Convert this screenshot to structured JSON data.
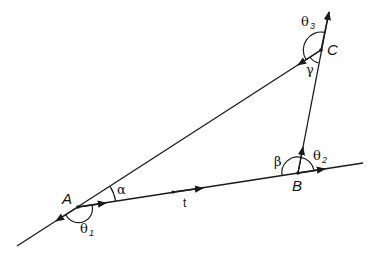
{
  "diagram": {
    "points": {
      "A": {
        "label": "A",
        "x": 78,
        "y": 207
      },
      "B": {
        "label": "B",
        "x": 298,
        "y": 173
      },
      "C": {
        "label": "C",
        "x": 321,
        "y": 50
      }
    },
    "angles": {
      "alpha": {
        "label": "α"
      },
      "beta": {
        "label": "β"
      },
      "gamma": {
        "label": "γ"
      },
      "theta1": {
        "base": "θ",
        "sub": "1"
      },
      "theta2": {
        "base": "θ",
        "sub": "2"
      },
      "theta3": {
        "base": "θ",
        "sub": "3"
      }
    },
    "vector_t": {
      "label": "t"
    },
    "colors": {
      "stroke": "#1a1a1a",
      "background": "#ffffff"
    }
  }
}
